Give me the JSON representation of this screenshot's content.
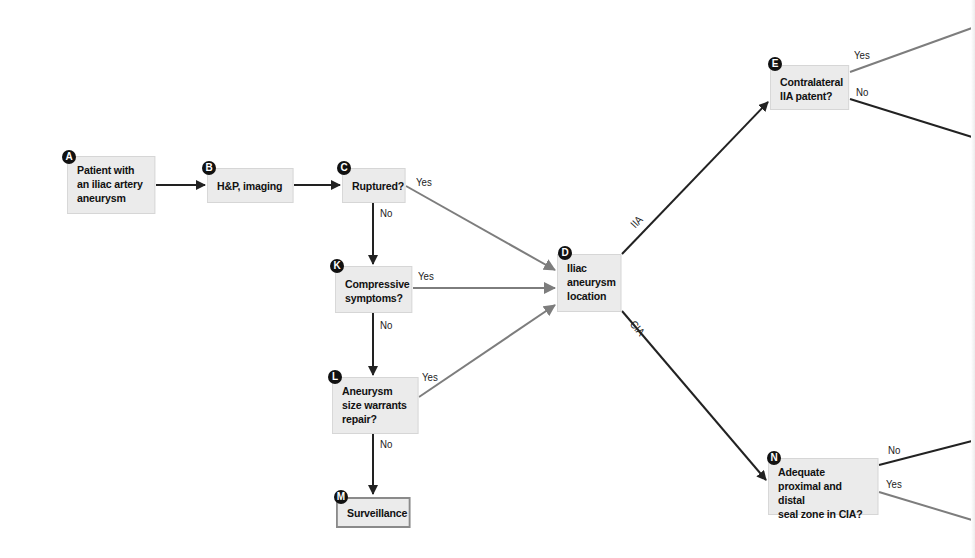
{
  "diagram": {
    "type": "flowchart",
    "colors": {
      "node_fill": "#ebebeb",
      "node_border": "#d6d6d6",
      "terminal_border": "#8a8a8a",
      "dark_arrow": "#222222",
      "gray_arrow": "#808080",
      "badge": "#111111"
    },
    "nodes": [
      {
        "id": "A",
        "text": "Patient with\nan iliac artery\naneurysm"
      },
      {
        "id": "B",
        "text": "H&P, imaging"
      },
      {
        "id": "C",
        "text": "Ruptured?"
      },
      {
        "id": "K",
        "text": "Compressive\nsymptoms?"
      },
      {
        "id": "L",
        "text": "Aneurysm\nsize warrants\nrepair?"
      },
      {
        "id": "M",
        "text": "Surveillance"
      },
      {
        "id": "D",
        "text": "Iliac\naneurysm\nlocation"
      },
      {
        "id": "E",
        "text": "Contralateral\nIIA patent?"
      },
      {
        "id": "N",
        "text": "Adequate\nproximal and distal\nseal zone in CIA?"
      }
    ],
    "edge_labels": {
      "c_yes": "Yes",
      "c_no": "No",
      "k_yes": "Yes",
      "k_no": "No",
      "l_yes": "Yes",
      "l_no": "No",
      "d_iia": "IIA",
      "d_cia": "CIA",
      "e_yes": "Yes",
      "e_no": "No",
      "n_no": "No",
      "n_yes": "Yes"
    },
    "edges": [
      {
        "from": "A",
        "to": "B",
        "label": ""
      },
      {
        "from": "B",
        "to": "C",
        "label": ""
      },
      {
        "from": "C",
        "to": "D",
        "label": "Yes"
      },
      {
        "from": "C",
        "to": "K",
        "label": "No"
      },
      {
        "from": "K",
        "to": "D",
        "label": "Yes"
      },
      {
        "from": "K",
        "to": "L",
        "label": "No"
      },
      {
        "from": "L",
        "to": "D",
        "label": "Yes"
      },
      {
        "from": "L",
        "to": "M",
        "label": "No"
      },
      {
        "from": "D",
        "to": "E",
        "label": "IIA"
      },
      {
        "from": "D",
        "to": "N",
        "label": "CIA"
      },
      {
        "from": "E",
        "to": "(off-screen)",
        "label": "Yes"
      },
      {
        "from": "E",
        "to": "(off-screen)",
        "label": "No"
      },
      {
        "from": "N",
        "to": "(off-screen)",
        "label": "No"
      },
      {
        "from": "N",
        "to": "(off-screen)",
        "label": "Yes"
      }
    ]
  }
}
